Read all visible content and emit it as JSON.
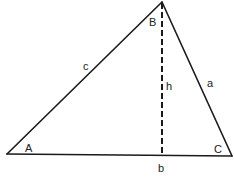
{
  "diagram": {
    "type": "triangle-with-altitude",
    "stroke_color": "#1a1a1a",
    "vertices": {
      "A": {
        "label": "A",
        "x": 7,
        "y": 154,
        "label_x": 25,
        "label_y": 152
      },
      "B": {
        "label": "B",
        "x": 162,
        "y": 2,
        "label_x": 149,
        "label_y": 26
      },
      "C": {
        "label": "C",
        "x": 232,
        "y": 156,
        "label_x": 214,
        "label_y": 153
      }
    },
    "sides": {
      "a": {
        "label": "a",
        "label_x": 207,
        "label_y": 87
      },
      "b": {
        "label": "b",
        "label_x": 158,
        "label_y": 172
      },
      "c": {
        "label": "c",
        "label_x": 83,
        "label_y": 70
      }
    },
    "altitude": {
      "label": "h",
      "from": "B",
      "foot_x": 162,
      "foot_y": 155,
      "style": "dashed",
      "label_x": 166,
      "label_y": 90
    }
  }
}
